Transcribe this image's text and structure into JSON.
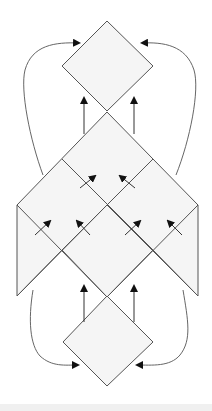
{
  "diagram": {
    "colors": {
      "background": "#ffffff",
      "shape_fill": "#f5f5f5",
      "shape_stroke": "#555555",
      "curve_stroke": "#666666",
      "arrow": "#111111",
      "bottom_strip": "#f0f0f0"
    },
    "nodes": [
      {
        "id": "top-diamond",
        "shape": "diamond",
        "points": [
          [
            107,
            21
          ],
          [
            153,
            66
          ],
          [
            107,
            111
          ],
          [
            62,
            66
          ]
        ]
      },
      {
        "id": "central-lattice",
        "shape": "polygon",
        "points": [
          [
            107,
            112
          ],
          [
            198,
            205
          ],
          [
            198,
            296
          ],
          [
            153,
            250
          ],
          [
            107,
            297
          ],
          [
            62,
            250
          ],
          [
            17,
            296
          ],
          [
            17,
            205
          ]
        ]
      },
      {
        "id": "bottom-diamond",
        "shape": "diamond",
        "points": [
          [
            107,
            296
          ],
          [
            153,
            342
          ],
          [
            107,
            386
          ],
          [
            63,
            342
          ]
        ]
      }
    ],
    "lattice_lines": [
      [
        [
          62,
          159
        ],
        [
          153,
          250
        ]
      ],
      [
        [
          153,
          159
        ],
        [
          62,
          250
        ]
      ],
      [
        [
          17,
          205
        ],
        [
          107,
          297
        ]
      ],
      [
        [
          198,
          205
        ],
        [
          107,
          297
        ]
      ],
      [
        [
          17,
          296
        ],
        [
          107,
          205
        ]
      ],
      [
        [
          198,
          296
        ],
        [
          107,
          205
        ]
      ]
    ],
    "straight_arrows": [
      {
        "from": [
          84,
          134
        ],
        "to": [
          84,
          98
        ]
      },
      {
        "from": [
          134,
          134
        ],
        "to": [
          134,
          98
        ]
      },
      {
        "from": [
          84,
          322
        ],
        "to": [
          84,
          286
        ]
      },
      {
        "from": [
          134,
          322
        ],
        "to": [
          134,
          286
        ]
      }
    ],
    "diagonal_arrows": [
      {
        "from": [
          80,
          188
        ],
        "to": [
          95,
          176
        ]
      },
      {
        "from": [
          135,
          188
        ],
        "to": [
          120,
          176
        ]
      },
      {
        "from": [
          35,
          235
        ],
        "to": [
          50,
          221
        ]
      },
      {
        "from": [
          90,
          235
        ],
        "to": [
          77,
          221
        ]
      },
      {
        "from": [
          125,
          235
        ],
        "to": [
          140,
          221
        ]
      },
      {
        "from": [
          182,
          235
        ],
        "to": [
          168,
          221
        ]
      }
    ],
    "curved_arrows": [
      {
        "id": "left-top",
        "path": "M43,175 C30,140 20,90 25,70 C32,45 55,42 79,43"
      },
      {
        "id": "right-top",
        "path": "M176,175 C190,140 200,90 194,70 C186,45 163,42 142,43"
      },
      {
        "id": "left-bottom",
        "path": "M33,290 C28,320 30,345 40,356 C52,367 65,365 78,365"
      },
      {
        "id": "right-bottom",
        "path": "M183,290 C188,320 192,340 180,355 C170,367 152,365 137,365"
      }
    ]
  }
}
